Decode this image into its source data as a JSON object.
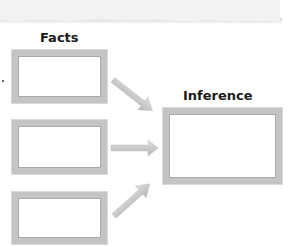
{
  "diagram": {
    "facts_heading": "Facts",
    "inference_heading": "Inference",
    "fact_boxes": [
      "",
      "",
      ""
    ],
    "inference_box": "",
    "arrows": [
      {
        "from": "fact-1",
        "to": "inference",
        "direction": "down-right"
      },
      {
        "from": "fact-2",
        "to": "inference",
        "direction": "right"
      },
      {
        "from": "fact-3",
        "to": "inference",
        "direction": "up-right"
      }
    ],
    "colors": {
      "box_border": "#c4c4c4",
      "arrow": "#c8c8c8",
      "text": "#1a1a1a"
    }
  }
}
